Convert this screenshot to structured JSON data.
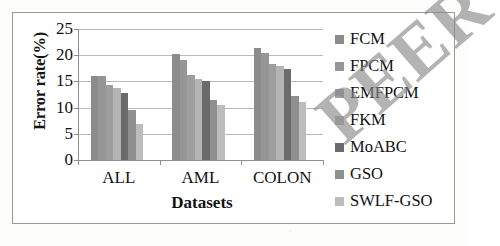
{
  "figure": {
    "watermark_text": "PEER",
    "background_color": "#ffffff",
    "frame_color": "#9a9a9a"
  },
  "chart_data": {
    "type": "bar",
    "title": "",
    "xlabel": "Datasets",
    "ylabel": "Error rate(%)",
    "categories": [
      "ALL",
      "AML",
      "COLON"
    ],
    "ylim": [
      0,
      25
    ],
    "yticks": [
      0,
      5,
      10,
      15,
      20,
      25
    ],
    "ytick_labels": [
      "0",
      "5",
      "10",
      "15",
      "20",
      "25"
    ],
    "grid": true,
    "legend_position": "right",
    "series": [
      {
        "name": "FCM",
        "color": "#8c8c8c",
        "values": [
          16.0,
          20.2,
          21.3
        ]
      },
      {
        "name": "FPCM",
        "color": "#969696",
        "values": [
          16.0,
          19.1,
          20.4
        ]
      },
      {
        "name": "EMFPCM",
        "color": "#9e9e9e",
        "values": [
          14.3,
          16.3,
          18.3
        ]
      },
      {
        "name": "FKM",
        "color": "#b4b4b4",
        "values": [
          13.8,
          15.5,
          18.0
        ]
      },
      {
        "name": "MoABC",
        "color": "#6b6b6b",
        "values": [
          12.8,
          15.1,
          17.3
        ]
      },
      {
        "name": "GSO",
        "color": "#8f8f8f",
        "values": [
          9.5,
          11.5,
          12.3
        ]
      },
      {
        "name": "SWLF-GSO",
        "color": "#bcbcbc",
        "values": [
          6.8,
          10.5,
          11.1
        ]
      }
    ]
  }
}
